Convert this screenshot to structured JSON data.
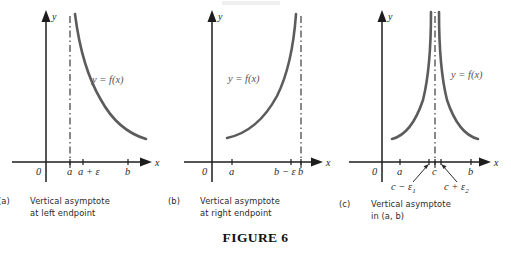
{
  "figure": {
    "number_label": "FIGURE 6",
    "axis_x_name": "x",
    "axis_y_name": "y",
    "origin_label": "0",
    "curve_label": "y = f(x)",
    "curve_color": "#5c5c5c",
    "axis_color": "#1d1d1d",
    "background": "#ffffff"
  },
  "panels": [
    {
      "tag": "(a)",
      "caption_line1": "Vertical asymptote",
      "caption_line2": "at left endpoint",
      "curve_label": "y = f(x)",
      "origin_label": "0",
      "axis_x_name": "x",
      "axis_y_name": "y",
      "asymptote_style": "dash-dot vertical at a",
      "tick_labels": [
        "a",
        "a + ε",
        "b"
      ]
    },
    {
      "tag": "(b)",
      "caption_line1": "Vertical asymptote",
      "caption_line2": "at right endpoint",
      "curve_label": "y = f(x)",
      "origin_label": "0",
      "axis_x_name": "x",
      "axis_y_name": "y",
      "asymptote_style": "dash-dot vertical at b",
      "tick_labels": [
        "a",
        "b − ε",
        "b"
      ]
    },
    {
      "tag": "(c)",
      "caption_line1": "Vertical asymptote",
      "caption_line2": "in (a, b)",
      "curve_label": "y = f(x)",
      "origin_label": "0",
      "axis_x_name": "x",
      "axis_y_name": "y",
      "asymptote_style": "dash-dot vertical at c",
      "tick_labels": [
        "a",
        "c",
        "b"
      ],
      "pointer_labels": [
        {
          "base": "c − ε",
          "subscript": "1"
        },
        {
          "base": "c + ε",
          "subscript": "2"
        }
      ]
    }
  ]
}
